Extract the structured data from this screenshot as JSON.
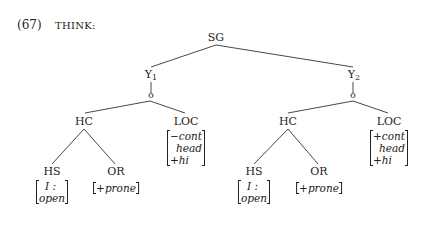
{
  "example": {
    "number": "(67)",
    "title": "THINK:"
  },
  "tree": {
    "root": "SG",
    "left": {
      "label": "Y",
      "subscript": "1",
      "junction": "o",
      "hc": "HC",
      "loc": "LOC",
      "loc_features": [
        "−cont",
        "head",
        "+hi"
      ],
      "hs": "HS",
      "hs_features": [
        "I :",
        "open"
      ],
      "or": "OR",
      "or_features": [
        "+prone"
      ]
    },
    "right": {
      "label": "Y",
      "subscript": "2",
      "junction": "o",
      "hc": "HC",
      "loc": "LOC",
      "loc_features": [
        "+cont",
        "head",
        "+hi"
      ],
      "hs": "HS",
      "hs_features": [
        "I :",
        "open"
      ],
      "or": "OR",
      "or_features": [
        "+prone"
      ]
    }
  }
}
